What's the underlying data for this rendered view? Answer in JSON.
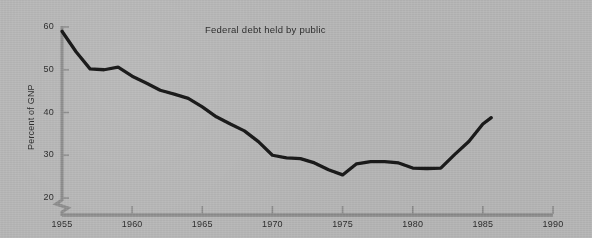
{
  "chart_data": {
    "type": "line",
    "title": "Federal debt held by public",
    "xlabel": "",
    "ylabel": "Percent of GNP",
    "xlim": [
      1955,
      1990
    ],
    "ylim": [
      20,
      60
    ],
    "y_axis_break": true,
    "grid": false,
    "legend": "none",
    "xticks": [
      "1955",
      "1960",
      "1965",
      "1970",
      "1975",
      "1980",
      "1985",
      "1990"
    ],
    "xtick_values": [
      1955,
      1960,
      1965,
      1970,
      1975,
      1980,
      1985,
      1990
    ],
    "yticks": [
      "20",
      "30",
      "40",
      "50",
      "60"
    ],
    "ytick_values": [
      20,
      30,
      40,
      50,
      60
    ],
    "series": [
      {
        "name": "Federal debt held by public",
        "color": "#1a1a1a",
        "x": [
          1955,
          1956,
          1957,
          1958,
          1959,
          1960,
          1961,
          1962,
          1963,
          1964,
          1965,
          1966,
          1967,
          1968,
          1969,
          1970,
          1971,
          1972,
          1973,
          1974,
          1975,
          1976,
          1977,
          1978,
          1979,
          1980,
          1981,
          1982,
          1983,
          1984,
          1985,
          1985.6
        ],
        "values": [
          59.0,
          54.2,
          50.2,
          50.0,
          50.6,
          48.5,
          46.9,
          45.2,
          44.3,
          43.3,
          41.3,
          39.0,
          37.3,
          35.7,
          33.2,
          30.0,
          29.4,
          29.2,
          28.2,
          26.6,
          25.4,
          28.0,
          28.5,
          28.5,
          28.2,
          27.0,
          26.9,
          27.0,
          30.2,
          33.2,
          37.3,
          38.8
        ]
      }
    ]
  },
  "axes": {
    "title_text": "Federal debt held by public",
    "ylabel_text": "Percent of GNP"
  },
  "colors": {
    "background": "#b4b4b4",
    "axis": "#8c8c8c",
    "line": "#1a1a1a",
    "text": "#2d2d2d"
  }
}
